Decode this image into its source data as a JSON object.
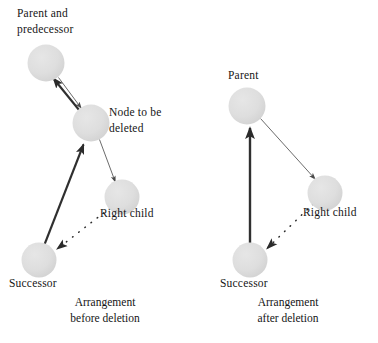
{
  "figure": {
    "background_color": "#ffffff",
    "node_fill_color": "#dcdcdc",
    "thick_arrow_color": "#2b2b2b",
    "thin_arrow_color": "#555555",
    "dotted_arrow_color": "#2b2b2b",
    "text_color": "#151515"
  },
  "left_panel": {
    "caption_line1": "Arrangement",
    "caption_line2": "before deletion",
    "labels": {
      "parent_line1": "Parent and",
      "parent_line2": "predecessor",
      "node_line1": "Node to be",
      "node_line2": "deleted",
      "right_child": "Right child",
      "successor": "Successor"
    },
    "nodes": [
      {
        "name": "parent-and-predecessor",
        "cx": 46,
        "cy": 63,
        "r": 18
      },
      {
        "name": "node-to-be-deleted",
        "cx": 91,
        "cy": 123,
        "r": 18
      },
      {
        "name": "right-child",
        "cx": 122,
        "cy": 197,
        "r": 17
      },
      {
        "name": "successor",
        "cx": 39,
        "cy": 260,
        "r": 17
      }
    ],
    "edges": [
      {
        "name": "parent-to-node",
        "style": "thin",
        "from": "parent-and-predecessor",
        "to": "node-to-be-deleted"
      },
      {
        "name": "node-to-parent",
        "style": "thick",
        "from": "node-to-be-deleted",
        "to": "parent-and-predecessor"
      },
      {
        "name": "node-to-right-child",
        "style": "thin",
        "from": "node-to-be-deleted",
        "to": "right-child"
      },
      {
        "name": "successor-to-node",
        "style": "thick",
        "from": "successor",
        "to": "node-to-be-deleted"
      },
      {
        "name": "right-child-to-successor",
        "style": "dotted",
        "from": "right-child",
        "to": "successor"
      }
    ]
  },
  "right_panel": {
    "caption_line1": "Arrangement",
    "caption_line2": "after deletion",
    "labels": {
      "parent": "Parent",
      "right_child": "Right child",
      "successor": "Successor"
    },
    "nodes": [
      {
        "name": "parent",
        "cx": 247,
        "cy": 106,
        "r": 18
      },
      {
        "name": "right-child",
        "cx": 325,
        "cy": 193,
        "r": 17
      },
      {
        "name": "successor",
        "cx": 250,
        "cy": 260,
        "r": 17
      }
    ],
    "edges": [
      {
        "name": "parent-to-right-child",
        "style": "thin",
        "from": "parent",
        "to": "right-child"
      },
      {
        "name": "successor-to-parent",
        "style": "thick",
        "from": "successor",
        "to": "parent"
      },
      {
        "name": "right-child-to-successor",
        "style": "dotted",
        "from": "right-child",
        "to": "successor"
      }
    ]
  }
}
